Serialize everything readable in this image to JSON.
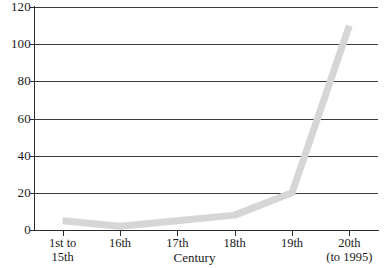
{
  "chart_data": {
    "type": "line",
    "title": "",
    "subtitle": "",
    "xlabel": "Century",
    "ylabel": "",
    "categories": [
      "1st to\n15th",
      "16th",
      "17th",
      "18th",
      "19th",
      "20th\n(to 1995)"
    ],
    "category_lines": [
      [
        "1st to",
        "15th"
      ],
      [
        "16th",
        ""
      ],
      [
        "17th",
        ""
      ],
      [
        "18th",
        ""
      ],
      [
        "19th",
        ""
      ],
      [
        "20th",
        "(to 1995)"
      ]
    ],
    "values": [
      5,
      2,
      5,
      8,
      20,
      110
    ],
    "series": [
      {
        "name": "",
        "values": [
          5,
          2,
          5,
          8,
          20,
          110
        ]
      }
    ],
    "ylim": [
      0,
      120
    ],
    "ytick_values": [
      0,
      20,
      40,
      60,
      80,
      100,
      120
    ],
    "ytick_labels": [
      "0",
      "20",
      "40",
      "60",
      "80",
      "100",
      "120"
    ],
    "grid": "horizontal",
    "legend": "none",
    "line_color": "#d6d6d6",
    "line_width_px": 7,
    "axis_color": "#2b2b2b",
    "gridline_color": "#3a3a3a",
    "background_color": "#ffffff",
    "text_color": "#1a1a1a"
  }
}
